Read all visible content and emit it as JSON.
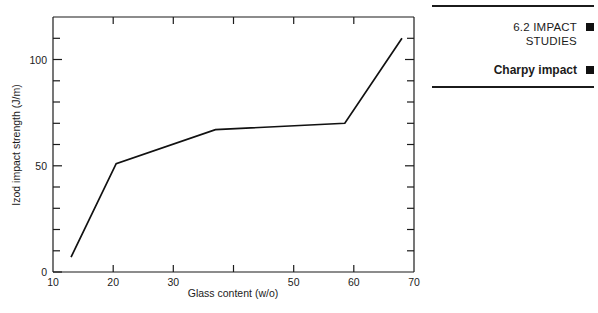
{
  "figure": {
    "name": "izod-impact-strength-vs-glass-content"
  },
  "chart_data": {
    "type": "line",
    "title": "",
    "xlabel": "Glass content (w/o)",
    "ylabel": "Izod impact strength (J/m)",
    "xlim": [
      10,
      70
    ],
    "ylim": [
      0,
      120
    ],
    "grid": false,
    "legend": "none",
    "x_ticks_major": [
      10,
      20,
      30,
      40,
      50,
      60,
      70
    ],
    "x_tick_labels": [
      "10",
      "20",
      "30",
      "40",
      "50",
      "60",
      "70"
    ],
    "x_tick_labels_hidden": [
      "40"
    ],
    "y_ticks_minor_step": 10,
    "y_ticks_major": [
      0,
      50,
      100
    ],
    "y_tick_labels": [
      "0",
      "50",
      "100"
    ],
    "series": [
      {
        "name": "Izod impact strength",
        "x": [
          13,
          20.5,
          37,
          58.5,
          68
        ],
        "values": [
          7,
          51,
          67,
          70,
          110
        ]
      }
    ]
  },
  "margin_panel": {
    "rule_top": "horizontal-rule",
    "rule_bottom": "horizontal-rule",
    "entries": [
      {
        "label": "6.2  IMPACT\nSTUDIES",
        "marker": "filled-square"
      },
      {
        "label": "Charpy impact",
        "marker": "filled-square"
      }
    ]
  },
  "colors": {
    "ink": "#1b1b1b",
    "line": "#111111",
    "background": "#ffffff"
  }
}
